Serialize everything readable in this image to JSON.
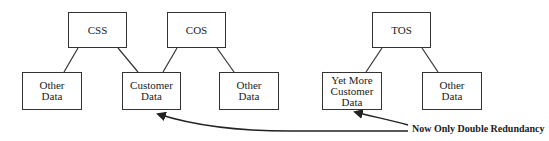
{
  "diagram": {
    "top_nodes": [
      {
        "id": "css",
        "label": "CSS"
      },
      {
        "id": "cos",
        "label": "COS"
      },
      {
        "id": "tos",
        "label": "TOS"
      }
    ],
    "bottom_nodes": [
      {
        "id": "other1",
        "label": "Other\nData",
        "parent": "css"
      },
      {
        "id": "customer",
        "label": "Customer\nData",
        "parents": [
          "css",
          "cos"
        ]
      },
      {
        "id": "other2",
        "label": "Other\nData",
        "parent": "cos"
      },
      {
        "id": "yetmore",
        "label": "Yet More\nCustomer\nData",
        "parent": "tos"
      },
      {
        "id": "other3",
        "label": "Other\nData",
        "parent": "tos"
      }
    ],
    "annotation": {
      "label": "Now Only Double Redundancy",
      "points_to": [
        "customer",
        "yetmore"
      ]
    },
    "colors": {
      "line": "#333333",
      "background": "#ffffff",
      "text": "#222222"
    }
  }
}
